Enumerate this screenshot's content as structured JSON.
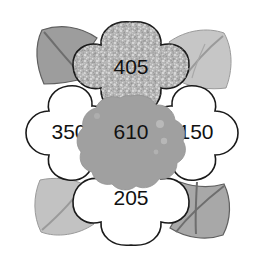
{
  "figure": {
    "name": "flower-value-diagram",
    "background_color": "#ffffff",
    "outline_color": "#1a1a1a"
  },
  "center": {
    "label": "610",
    "fill_color": "#a0a0a0",
    "name": "flower-center"
  },
  "petals": [
    {
      "id": "top",
      "label": "405",
      "fill_color": "#b8b8b8",
      "texture": "speckled",
      "cx": 131,
      "cy": 68
    },
    {
      "id": "left",
      "label": "350",
      "fill_color": "#ffffff",
      "texture": "plain",
      "cx": 68,
      "cy": 133
    },
    {
      "id": "right",
      "label": "150",
      "fill_color": "#ffffff",
      "texture": "plain",
      "cx": 196,
      "cy": 133
    },
    {
      "id": "bottom",
      "label": "205",
      "fill_color": "#ffffff",
      "texture": "plain",
      "cx": 131,
      "cy": 199
    }
  ],
  "leaves": [
    {
      "id": "top-left",
      "fill_color": "#9d9d9d",
      "vein_color": "#6e6e6e"
    },
    {
      "id": "top-right",
      "fill_color": "#c6c6c6",
      "vein_color": "#9a9a9a"
    },
    {
      "id": "bottom-left",
      "fill_color": "#c2c2c2",
      "vein_color": "#9a9a9a"
    },
    {
      "id": "bottom-right",
      "fill_color": "#a8a8a8",
      "vein_color": "#6e6e6e"
    }
  ]
}
